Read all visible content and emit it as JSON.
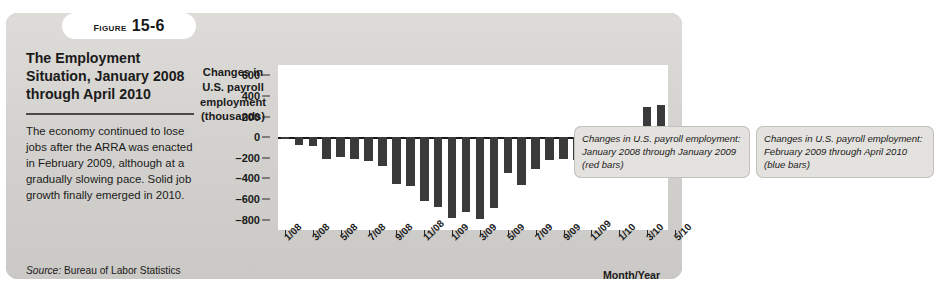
{
  "figure": {
    "word": "Figure",
    "number": "15-6"
  },
  "caption": {
    "title": "The Employment Situation, January 2008 through April 2010",
    "body": "The economy continued to lose jobs after the ARRA was enacted in February 2009, although at a gradually slowing pace. Solid job growth finally emerged in 2010.",
    "source_label": "Source:",
    "source_text": "Bureau of Labor Statistics"
  },
  "annotations": {
    "red": "Changes in U.S. payroll employment: January 2008 through January 2009 (red bars)",
    "blue": "Changes in U.S. payroll employment: February 2009 through April 2010 (blue bars)"
  },
  "chart_data": {
    "type": "bar",
    "title": "The Employment Situation, January 2008 through April 2010",
    "ylabel": "Changes in U.S. payroll employment (thousands)",
    "xlabel": "Month/Year",
    "ylim": [
      -900,
      700
    ],
    "yticks": [
      600,
      400,
      200,
      0,
      -200,
      -400,
      -600,
      -800
    ],
    "grid": false,
    "bar_color": "#3a3a3a",
    "categories": [
      "1/08",
      "2/08",
      "3/08",
      "4/08",
      "5/08",
      "6/08",
      "7/08",
      "8/08",
      "9/08",
      "10/08",
      "11/08",
      "12/08",
      "1/09",
      "2/09",
      "3/09",
      "4/09",
      "5/09",
      "6/09",
      "7/09",
      "8/09",
      "9/09",
      "10/09",
      "11/09",
      "12/09",
      "1/10",
      "2/10",
      "3/10",
      "4/10"
    ],
    "xtick_labels": [
      "1/08",
      "3/08",
      "5/08",
      "7/08",
      "9/08",
      "11/08",
      "1/09",
      "3/09",
      "5/09",
      "7/09",
      "9/09",
      "11/09",
      "1/10",
      "3/10",
      "5/10"
    ],
    "values": [
      -20,
      -80,
      -90,
      -210,
      -190,
      -210,
      -230,
      -280,
      -450,
      -470,
      -620,
      -680,
      -780,
      -730,
      -790,
      -690,
      -350,
      -460,
      -310,
      -220,
      -210,
      -220,
      60,
      -120,
      20,
      40,
      290,
      310
    ],
    "series": [
      {
        "name": "Changes in U.S. payroll employment: January 2008 through January 2009 (red bars)",
        "color": "#3a3a3a",
        "range": [
          "1/08",
          "1/09"
        ]
      },
      {
        "name": "Changes in U.S. payroll employment: February 2009 through April 2010 (blue bars)",
        "color": "#3a3a3a",
        "range": [
          "2/09",
          "4/10"
        ]
      }
    ]
  }
}
